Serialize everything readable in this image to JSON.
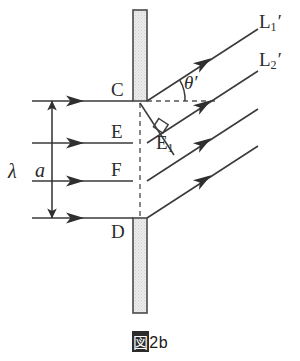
{
  "figure": {
    "caption_kanji": "図",
    "caption_number": "2b",
    "caption_full": "図2b",
    "background_color": "#ffffff",
    "line_color": "#3a3a3a",
    "barrier_fill": "#e8e8e8",
    "barrier_border": "#4a4a4a",
    "dash_color": "#555555"
  },
  "labels": {
    "point_c": "C",
    "point_d": "D",
    "point_e": "E",
    "point_f": "F",
    "point_e1_main": "E",
    "point_e1_sub": "1",
    "wavelength": "λ",
    "slit_width": "a",
    "angle": "θ",
    "angle_prime": "′",
    "ray1_main": "L",
    "ray1_sub": "1",
    "ray1_prime": "′",
    "ray2_main": "L",
    "ray2_sub": "2",
    "ray2_prime": "′"
  },
  "geometry": {
    "barrier_x": 133,
    "barrier_width": 14,
    "barrier_top_y1": 10,
    "barrier_top_y2": 101,
    "barrier_bottom_y1": 218,
    "barrier_bottom_y2": 313,
    "slit_top_y": 101,
    "slit_bottom_y": 218,
    "incoming_ray_x_start": 32,
    "incoming_ray_ys": [
      101,
      143,
      181,
      218
    ],
    "outgoing_angle_deg": 33,
    "dimension_arrow_x": 52,
    "dashed_horizontal_x_end": 218
  },
  "physics": {
    "description": "single-slit diffraction geometry",
    "slit_edges": [
      "C",
      "D"
    ],
    "path_difference_point": "E1",
    "diffracted_rays": [
      "L1'",
      "L2'"
    ],
    "incident_wavefront_label": "λ",
    "slit_width_label": "a",
    "diffraction_angle_label": "θ'"
  }
}
